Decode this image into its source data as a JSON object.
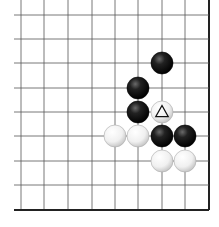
{
  "diagram": {
    "type": "go-board-fragment",
    "grid": {
      "columns_x": [
        21,
        44,
        68,
        92,
        115,
        138,
        162,
        185,
        209
      ],
      "rows_y": [
        15,
        39,
        63,
        88,
        112,
        136,
        161,
        185,
        210
      ],
      "edges": [
        "right",
        "bottom"
      ],
      "line_color": "#555555",
      "edge_color": "#222222"
    },
    "stones": [
      {
        "color": "black",
        "col": 6,
        "row": 2
      },
      {
        "color": "black",
        "col": 5,
        "row": 3
      },
      {
        "color": "black",
        "col": 5,
        "row": 4
      },
      {
        "color": "white",
        "col": 6,
        "row": 4,
        "mark": "triangle"
      },
      {
        "color": "white",
        "col": 4,
        "row": 5
      },
      {
        "color": "white",
        "col": 5,
        "row": 5
      },
      {
        "color": "black",
        "col": 6,
        "row": 5
      },
      {
        "color": "black",
        "col": 7,
        "row": 5
      },
      {
        "color": "white",
        "col": 6,
        "row": 6
      },
      {
        "color": "white",
        "col": 7,
        "row": 6
      }
    ],
    "stone_radius": 11
  }
}
